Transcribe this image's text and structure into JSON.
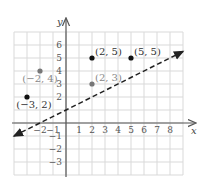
{
  "chart_data": {
    "type": "scatter",
    "title": "",
    "xlabel": "x",
    "ylabel": "y",
    "xlim": [
      -4,
      9
    ],
    "ylim": [
      -4,
      7
    ],
    "grid": true,
    "x_ticks": [
      -2,
      -1,
      1,
      2,
      3,
      4,
      5,
      6,
      7,
      8
    ],
    "y_ticks": [
      -3,
      -2,
      -1,
      2,
      3,
      4,
      5,
      6
    ],
    "points": [
      {
        "x": 2,
        "y": 5,
        "label": "(2, 5)",
        "color": "#111111"
      },
      {
        "x": 5,
        "y": 5,
        "label": "(5, 5)",
        "color": "#111111"
      },
      {
        "x": -2,
        "y": 4,
        "label": "(−2, 4)",
        "color": "#777777"
      },
      {
        "x": 2,
        "y": 3,
        "label": "(2, 3)",
        "color": "#777777"
      },
      {
        "x": -3,
        "y": 2,
        "label": "(−3, 2)",
        "color": "#111111"
      }
    ],
    "lines": [
      {
        "style": "dashed",
        "slope": 0.5,
        "intercept": 1,
        "from": [
          -4,
          -1
        ],
        "to": [
          9,
          5.5
        ],
        "arrows": "both",
        "color": "#222222"
      }
    ]
  },
  "colors": {
    "grid": "#d9d9d9",
    "axis": "#555555",
    "dark_point": "#111111",
    "light_point": "#777777"
  }
}
